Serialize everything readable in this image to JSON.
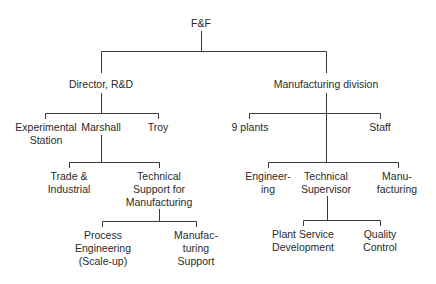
{
  "diagram": {
    "type": "org-chart",
    "root": {
      "id": "ff",
      "lines": [
        "F&F"
      ]
    },
    "nodes": {
      "director_rd": {
        "lines": [
          "Director, R&D"
        ]
      },
      "manufacturing_division": {
        "lines": [
          "Manufacturing division"
        ]
      },
      "experimental_station": {
        "lines": [
          "Experimental",
          "Station"
        ]
      },
      "marshall": {
        "lines": [
          "Marshall"
        ]
      },
      "troy": {
        "lines": [
          "Troy"
        ]
      },
      "nine_plants": {
        "lines": [
          "9 plants"
        ]
      },
      "staff": {
        "lines": [
          "Staff"
        ]
      },
      "trade_industrial": {
        "lines": [
          "Trade &",
          "Industrial"
        ]
      },
      "technical_support": {
        "lines": [
          "Technical",
          "Support for",
          "Manufacturing"
        ]
      },
      "process_engineering": {
        "lines": [
          "Process",
          "Engineering",
          "(Scale-up)"
        ]
      },
      "manufacturing_support": {
        "lines": [
          "Manufac-",
          "turing",
          "Support"
        ]
      },
      "engineering": {
        "lines": [
          "Engineer-",
          "ing"
        ]
      },
      "technical_supervisor": {
        "lines": [
          "Technical",
          "Supervisor"
        ]
      },
      "manufacturing": {
        "lines": [
          "Manu-",
          "facturing"
        ]
      },
      "plant_service_development": {
        "lines": [
          "Plant Service",
          "Development"
        ]
      },
      "quality_control": {
        "lines": [
          "Quality",
          "Control"
        ]
      }
    },
    "edges": [
      [
        "ff",
        "director_rd"
      ],
      [
        "ff",
        "manufacturing_division"
      ],
      [
        "director_rd",
        "experimental_station"
      ],
      [
        "director_rd",
        "marshall"
      ],
      [
        "director_rd",
        "troy"
      ],
      [
        "manufacturing_division",
        "nine_plants"
      ],
      [
        "manufacturing_division",
        "staff"
      ],
      [
        "marshall",
        "trade_industrial"
      ],
      [
        "marshall",
        "technical_support"
      ],
      [
        "technical_support",
        "process_engineering"
      ],
      [
        "technical_support",
        "manufacturing_support"
      ],
      [
        "manufacturing_division",
        "engineering"
      ],
      [
        "manufacturing_division",
        "technical_supervisor"
      ],
      [
        "manufacturing_division",
        "manufacturing"
      ],
      [
        "technical_supervisor",
        "plant_service_development"
      ],
      [
        "technical_supervisor",
        "quality_control"
      ]
    ]
  }
}
